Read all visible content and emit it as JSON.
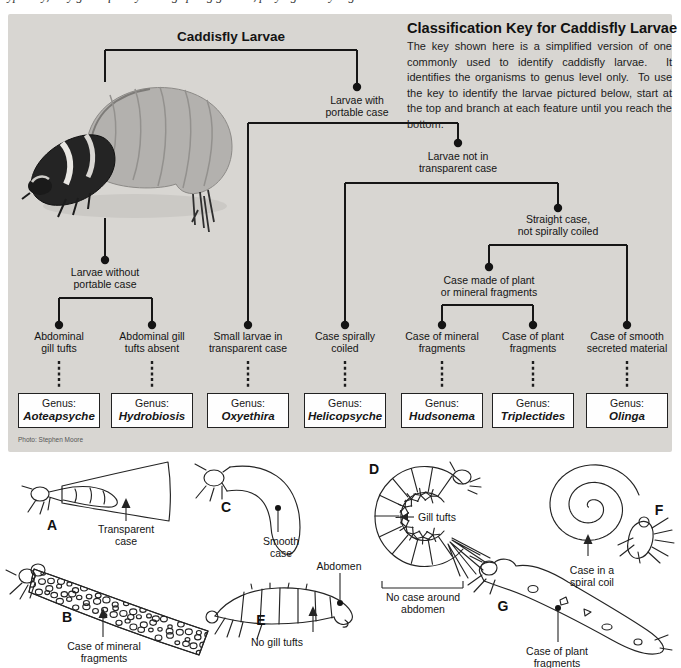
{
  "page": {
    "cropped_line": "typically, they grow quickly among spring gravels, preying on tiny organisms"
  },
  "panel": {
    "header": {
      "title": "Classification Key for Caddisfly Larvae",
      "intro": "The key shown here is a simplified version of one commonly used to identify caddisfly larvae.  It identifies the organisms to genus level only.  To use the key to identify the larvae pictured below, start at the top and branch at each feature until you reach the bottom."
    },
    "tree": {
      "root": "Caddisfly Larvae",
      "with_case": [
        "Larvae with",
        "portable case"
      ],
      "not_transparent": [
        "Larvae not in",
        "transparent case"
      ],
      "straight_case": [
        "Straight case,",
        "not spirally coiled"
      ],
      "plant_or_mineral": [
        "Case made of plant",
        "or mineral fragments"
      ],
      "without_case": [
        "Larvae without",
        "portable case"
      ],
      "leaves": [
        [
          "Abdominal",
          "gill tufts"
        ],
        [
          "Abdominal gill",
          "tufts absent"
        ],
        [
          "Small larvae in",
          "transparent case"
        ],
        [
          "Case spirally",
          "coiled"
        ],
        [
          "Case of mineral",
          "fragments"
        ],
        [
          "Case of plant",
          "fragments"
        ],
        [
          "Case of smooth",
          "secreted material"
        ]
      ]
    },
    "genus": [
      {
        "label": "Genus:",
        "name": "Aoteapsyche"
      },
      {
        "label": "Genus:",
        "name": "Hydrobiosis"
      },
      {
        "label": "Genus:",
        "name": "Oxyethira"
      },
      {
        "label": "Genus:",
        "name": "Helicopsyche"
      },
      {
        "label": "Genus:",
        "name": "Hudsonema"
      },
      {
        "label": "Genus:",
        "name": "Triplectides"
      },
      {
        "label": "Genus:",
        "name": "Olinga"
      }
    ],
    "photo_credit": "Photo: Stephen Moore"
  },
  "figures": {
    "a": {
      "letter": "A",
      "caption": [
        "Transparent",
        "case"
      ]
    },
    "b": {
      "letter": "B",
      "caption": [
        "Case of mineral",
        "fragments"
      ]
    },
    "c": {
      "letter": "C",
      "caption": [
        "Smooth",
        "case"
      ]
    },
    "d": {
      "letter": "D",
      "gill_tufts": "Gill tufts",
      "bracket": [
        "No case around",
        "abdomen"
      ]
    },
    "e": {
      "letter": "E",
      "abdomen": "Abdomen",
      "no_gill": "No gill tufts"
    },
    "f": {
      "letter": "F",
      "caption": [
        "Case in a",
        "spiral coil"
      ]
    },
    "g": {
      "letter": "G",
      "caption": [
        "Case of plant",
        "fragments"
      ]
    }
  }
}
